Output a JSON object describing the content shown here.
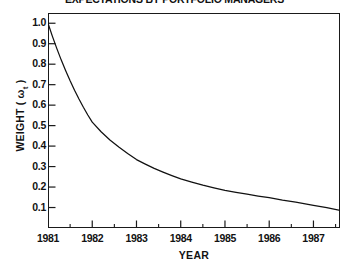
{
  "chart_data": {
    "type": "line",
    "title": "EXPECTATIONS BY PORTFOLIO MANAGERS",
    "xlabel": "YEAR",
    "ylabel_prefix": "WEIGHT ( ",
    "ylabel_symbol": "ω",
    "ylabel_subscript": "t",
    "ylabel_suffix": " )",
    "ylabel_full": "WEIGHT ( ωt )",
    "xlim": [
      1981,
      1987.6
    ],
    "ylim": [
      0.0,
      1.05
    ],
    "grid": false,
    "legend": null,
    "x_major_ticks": [
      1981,
      1982,
      1983,
      1984,
      1985,
      1986,
      1987
    ],
    "x_tick_labels": [
      "1981",
      "1982",
      "1983",
      "1984",
      "1985",
      "1986",
      "1987"
    ],
    "x_minor_ticks": [
      1981.5,
      1982.5,
      1983.5,
      1984.5,
      1985.5,
      1986.5,
      1987.5
    ],
    "y_major_ticks": [
      0.1,
      0.2,
      0.3,
      0.4,
      0.5,
      0.6,
      0.7,
      0.8,
      0.9,
      1.0
    ],
    "y_tick_labels": [
      "0.1",
      "0.2",
      "0.3",
      "0.4",
      "0.5",
      "0.6",
      "0.7",
      "0.8",
      "0.9",
      "1.0"
    ],
    "series": [
      {
        "name": "weight",
        "x": [
          1981.0,
          1981.1,
          1981.2,
          1981.3,
          1981.4,
          1981.5,
          1981.6,
          1981.7,
          1981.8,
          1981.9,
          1982.0,
          1982.2,
          1982.4,
          1982.6,
          1982.8,
          1983.0,
          1983.2,
          1983.4,
          1983.6,
          1983.8,
          1984.0,
          1984.25,
          1984.5,
          1984.75,
          1985.0,
          1985.25,
          1985.5,
          1985.75,
          1986.0,
          1986.3,
          1986.6,
          1987.0,
          1987.3,
          1987.6
        ],
        "values": [
          1.0,
          0.936,
          0.876,
          0.82,
          0.768,
          0.719,
          0.673,
          0.63,
          0.59,
          0.552,
          0.517,
          0.47,
          0.43,
          0.396,
          0.364,
          0.334,
          0.312,
          0.291,
          0.273,
          0.256,
          0.24,
          0.224,
          0.209,
          0.196,
          0.184,
          0.174,
          0.165,
          0.156,
          0.148,
          0.136,
          0.126,
          0.111,
          0.1,
          0.086
        ]
      }
    ]
  }
}
